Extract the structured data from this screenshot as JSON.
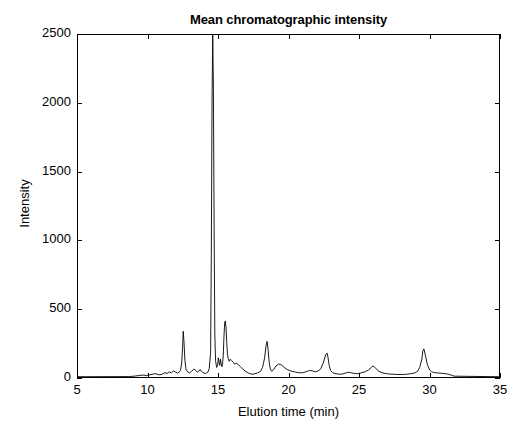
{
  "chart_data": {
    "type": "line",
    "title": "Mean chromatographic intensity",
    "xlabel": "Elution time (min)",
    "ylabel": "Intensity",
    "xlim": [
      5,
      35
    ],
    "ylim": [
      0,
      2500
    ],
    "xticks": [
      5,
      10,
      15,
      20,
      25,
      30,
      35
    ],
    "yticks": [
      0,
      500,
      1000,
      1500,
      2000,
      2500
    ],
    "grid": false,
    "legend": null,
    "line_color": "#000000",
    "line_width": 0.8,
    "clipped_peaks": [
      {
        "x": 14.6,
        "y_rendered": 2500,
        "note": "tallest peak clipped at top of axis"
      }
    ],
    "peaks": [
      {
        "x": 12.5,
        "y": 335
      },
      {
        "x": 14.6,
        "y": 2500
      },
      {
        "x": 15.5,
        "y": 410
      },
      {
        "x": 18.5,
        "y": 260
      },
      {
        "x": 22.8,
        "y": 175
      },
      {
        "x": 29.6,
        "y": 205
      }
    ],
    "series": [
      {
        "name": "mean intensity",
        "x": [
          5.0,
          8.6,
          9.0,
          9.3,
          9.6,
          9.9,
          10.2,
          10.5,
          10.8,
          11.0,
          11.2,
          11.35,
          11.5,
          11.65,
          11.8,
          11.95,
          12.1,
          12.2,
          12.3,
          12.38,
          12.45,
          12.5,
          12.55,
          12.62,
          12.7,
          12.8,
          12.95,
          13.1,
          13.25,
          13.4,
          13.5,
          13.6,
          13.7,
          13.8,
          13.95,
          14.1,
          14.25,
          14.35,
          14.45,
          14.5,
          14.55,
          14.6,
          14.65,
          14.7,
          14.75,
          14.8,
          14.88,
          14.95,
          15.0,
          15.05,
          15.1,
          15.15,
          15.2,
          15.25,
          15.3,
          15.35,
          15.4,
          15.45,
          15.5,
          15.55,
          15.6,
          15.65,
          15.7,
          15.78,
          15.85,
          15.95,
          16.05,
          16.15,
          16.3,
          16.45,
          16.6,
          16.75,
          16.9,
          17.05,
          17.2,
          17.4,
          17.6,
          17.8,
          18.0,
          18.15,
          18.3,
          18.4,
          18.48,
          18.55,
          18.62,
          18.7,
          18.8,
          18.95,
          19.1,
          19.3,
          19.5,
          19.7,
          19.9,
          20.1,
          20.3,
          20.5,
          20.7,
          20.9,
          21.1,
          21.3,
          21.5,
          21.7,
          21.9,
          22.1,
          22.3,
          22.5,
          22.65,
          22.75,
          22.82,
          22.9,
          23.0,
          23.15,
          23.3,
          23.5,
          23.7,
          23.9,
          24.1,
          24.3,
          24.5,
          24.7,
          24.9,
          25.1,
          25.3,
          25.5,
          25.7,
          25.9,
          26.0,
          26.1,
          26.25,
          26.4,
          26.6,
          26.8,
          27.0,
          27.2,
          27.5,
          27.8,
          28.1,
          28.4,
          28.7,
          29.0,
          29.2,
          29.35,
          29.5,
          29.58,
          29.65,
          29.75,
          29.9,
          30.05,
          30.2,
          30.4,
          30.6,
          30.8,
          31.0,
          31.2,
          31.4,
          31.6,
          31.8,
          35.0
        ],
        "y": [
          2,
          3,
          6,
          10,
          14,
          11,
          18,
          24,
          16,
          20,
          32,
          26,
          38,
          30,
          45,
          36,
          28,
          35,
          48,
          95,
          210,
          335,
          260,
          120,
          55,
          38,
          30,
          42,
          58,
          48,
          35,
          42,
          55,
          40,
          30,
          26,
          35,
          60,
          180,
          900,
          2000,
          2500,
          2100,
          1100,
          320,
          120,
          70,
          85,
          140,
          110,
          85,
          130,
          100,
          75,
          90,
          160,
          290,
          395,
          410,
          360,
          250,
          170,
          135,
          115,
          130,
          120,
          110,
          95,
          100,
          88,
          72,
          58,
          44,
          34,
          26,
          20,
          24,
          30,
          40,
          70,
          140,
          230,
          260,
          195,
          110,
          60,
          42,
          55,
          80,
          95,
          88,
          70,
          55,
          46,
          40,
          36,
          32,
          30,
          34,
          40,
          48,
          45,
          38,
          44,
          60,
          110,
          165,
          175,
          140,
          85,
          48,
          32,
          26,
          22,
          20,
          24,
          30,
          35,
          30,
          26,
          24,
          28,
          34,
          40,
          52,
          68,
          80,
          76,
          60,
          44,
          34,
          28,
          24,
          22,
          20,
          18,
          18,
          20,
          24,
          30,
          42,
          70,
          130,
          195,
          205,
          160,
          90,
          52,
          38,
          32,
          30,
          28,
          26,
          24,
          20,
          14,
          6,
          2
        ]
      }
    ]
  }
}
